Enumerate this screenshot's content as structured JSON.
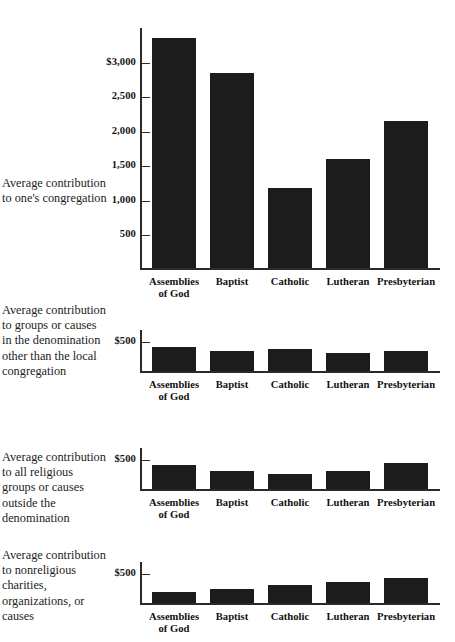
{
  "chart_data": [
    {
      "type": "bar",
      "panel_index": 0,
      "title": "Average contribution to one's congregation",
      "categories": [
        "Assemblies of God",
        "Baptist",
        "Catholic",
        "Lutheran",
        "Presbyterian"
      ],
      "values": [
        3320,
        2820,
        1160,
        1580,
        2130
      ],
      "xlabel": "",
      "ylabel": "",
      "ylim": [
        0,
        3500
      ],
      "yticks": [
        500,
        1000,
        1500,
        2000,
        2500,
        3000
      ],
      "ytick_labels": [
        "500",
        "1,000",
        "1,500",
        "2,000",
        "2,500",
        "$3,000"
      ],
      "grid": false,
      "legend": "none",
      "bar_color": "#1c1c1c"
    },
    {
      "type": "bar",
      "panel_index": 1,
      "title": "Average contribution to groups or causes in the denomination other than the local congregation",
      "categories": [
        "Assemblies of God",
        "Baptist",
        "Catholic",
        "Lutheran",
        "Presbyterian"
      ],
      "values": [
        390,
        330,
        365,
        300,
        325
      ],
      "xlabel": "",
      "ylabel": "",
      "ylim": [
        0,
        700
      ],
      "yticks": [
        500
      ],
      "ytick_labels": [
        "$500"
      ],
      "grid": false,
      "legend": "none",
      "bar_color": "#1c1c1c"
    },
    {
      "type": "bar",
      "panel_index": 2,
      "title": "Average contribution to all religious groups or causes outside the denomination",
      "categories": [
        "Assemblies of God",
        "Baptist",
        "Catholic",
        "Lutheran",
        "Presbyterian"
      ],
      "values": [
        390,
        300,
        250,
        290,
        420
      ],
      "xlabel": "",
      "ylabel": "",
      "ylim": [
        0,
        700
      ],
      "yticks": [
        500
      ],
      "ytick_labels": [
        "$500"
      ],
      "grid": false,
      "legend": "none",
      "bar_color": "#1c1c1c"
    },
    {
      "type": "bar",
      "panel_index": 3,
      "title": "Average contribution to nonreligious charities, organizations, or causes",
      "categories": [
        "Assemblies of God",
        "Baptist",
        "Catholic",
        "Lutheran",
        "Presbyterian"
      ],
      "values": [
        175,
        225,
        300,
        340,
        400
      ],
      "xlabel": "",
      "ylabel": "",
      "ylim": [
        0,
        700
      ],
      "yticks": [
        500
      ],
      "ytick_labels": [
        "$500"
      ],
      "grid": false,
      "legend": "none",
      "bar_color": "#1c1c1c"
    }
  ],
  "captions": {
    "panel1": "Average\ncontribution\nto one's\ncongregation",
    "panel2": "Average\ncontribution to\ngroups or\ncauses in the\ndenomination\nother than the\nlocal congregation",
    "panel3": "Average\ncontribution to all\nreligious groups\nor causes outside\nthe denomination",
    "panel4": "Average\ncontribution to\nnonreligious\ncharities,\norganizations,\nor causes"
  },
  "axis": {
    "categories": [
      "Assemblies\nof God",
      "Baptist",
      "Catholic",
      "Lutheran",
      "Presbyterian"
    ],
    "panel1_ytick_labels": [
      "$3,000",
      "2,500",
      "2,000",
      "1,500",
      "1,000",
      "500"
    ],
    "compact_ytick_label": "$500"
  }
}
